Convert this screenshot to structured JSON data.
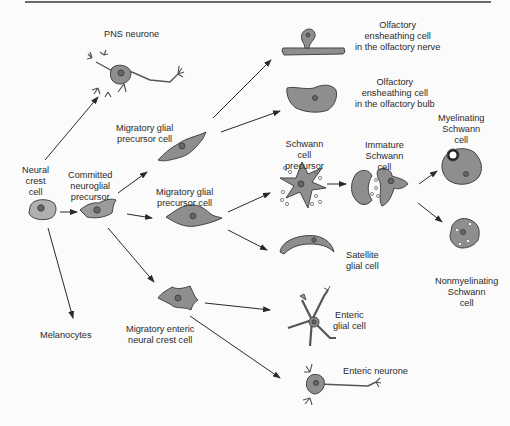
{
  "figure": {
    "colors": {
      "cell_fill": "#8e8e8e",
      "cell_stroke": "#444444",
      "arrow": "#2a2a2a",
      "background": "#fbfbfb",
      "light_fill": "#b8b8b8"
    },
    "nodes": {
      "neural_crest": {
        "lines": [
          "Neural",
          "crest",
          "cell"
        ]
      },
      "pns_neurone": {
        "lines": [
          "PNS neurone"
        ]
      },
      "melanocytes": {
        "lines": [
          "Melanocytes"
        ]
      },
      "committed_precursor": {
        "lines": [
          "Committed",
          "neuroglial",
          "precursor"
        ]
      },
      "migratory_glial_1": {
        "lines": [
          "Migratory glial",
          "precursor cell"
        ]
      },
      "migratory_glial_2": {
        "lines": [
          "Migratory glial",
          "precursor cell"
        ]
      },
      "migratory_enteric": {
        "lines": [
          "Migratory enteric",
          "neural crest cell"
        ]
      },
      "olfactory_nerve": {
        "lines": [
          "Olfactory",
          "ensheathing cell",
          "in the olfactory nerve"
        ]
      },
      "olfactory_bulb": {
        "lines": [
          "Olfactory",
          "ensheathing cell",
          "in the olfactory bulb"
        ]
      },
      "schwann_precursor": {
        "lines": [
          "Schwann",
          "cell",
          "precursor"
        ]
      },
      "immature_schwann": {
        "lines": [
          "Immature",
          "Schwann",
          "cell"
        ]
      },
      "myelinating_schwann": {
        "lines": [
          "Myelinating",
          "Schwann",
          "cell"
        ]
      },
      "nonmyelinating_schwann": {
        "lines": [
          "Nonmyelinating",
          "Schwann",
          "cell"
        ]
      },
      "satellite_glial": {
        "lines": [
          "Satellite",
          "glial cell"
        ]
      },
      "enteric_glial": {
        "lines": [
          "Enteric",
          "glial cell"
        ]
      },
      "enteric_neurone": {
        "lines": [
          "Enteric neurone"
        ]
      }
    },
    "edges": [
      [
        "neural_crest",
        "pns_neurone"
      ],
      [
        "neural_crest",
        "committed_precursor"
      ],
      [
        "neural_crest",
        "melanocytes"
      ],
      [
        "committed_precursor",
        "migratory_glial_1"
      ],
      [
        "committed_precursor",
        "migratory_glial_2"
      ],
      [
        "committed_precursor",
        "migratory_enteric"
      ],
      [
        "migratory_glial_1",
        "olfactory_nerve"
      ],
      [
        "migratory_glial_1",
        "olfactory_bulb"
      ],
      [
        "migratory_glial_2",
        "schwann_precursor"
      ],
      [
        "migratory_glial_2",
        "satellite_glial"
      ],
      [
        "schwann_precursor",
        "immature_schwann"
      ],
      [
        "immature_schwann",
        "myelinating_schwann"
      ],
      [
        "immature_schwann",
        "nonmyelinating_schwann"
      ],
      [
        "migratory_enteric",
        "enteric_glial"
      ],
      [
        "migratory_enteric",
        "enteric_neurone"
      ]
    ]
  }
}
